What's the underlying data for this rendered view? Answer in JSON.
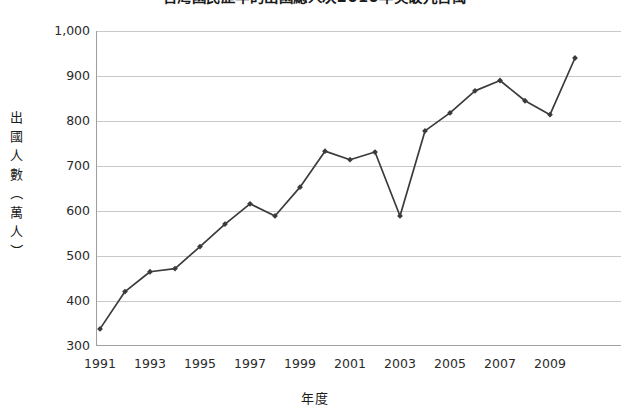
{
  "chart_data": {
    "type": "line",
    "title": "台灣國民歷年的出國總人次2010年突破九百萬",
    "xlabel": "年度",
    "ylabel": "出國人數（萬人）",
    "ylabel_chars": [
      "出",
      "國",
      "人",
      "數",
      "（",
      "萬",
      "人",
      "）"
    ],
    "x": [
      1991,
      1992,
      1993,
      1994,
      1995,
      1996,
      1997,
      1998,
      1999,
      2000,
      2001,
      2002,
      2003,
      2004,
      2005,
      2006,
      2007,
      2008,
      2009,
      2010
    ],
    "values": [
      338,
      421,
      465,
      472,
      521,
      571,
      616,
      589,
      653,
      733,
      714,
      731,
      589,
      778,
      818,
      867,
      890,
      845,
      814,
      940
    ],
    "series": [
      {
        "name": "出國人數（萬人）",
        "values": [
          338,
          421,
          465,
          472,
          521,
          571,
          616,
          589,
          653,
          733,
          714,
          731,
          589,
          778,
          818,
          867,
          890,
          845,
          814,
          940
        ]
      }
    ],
    "xlim": [
      1990.5,
      2010.5
    ],
    "ylim": [
      300,
      1000
    ],
    "yticks": [
      300,
      400,
      500,
      600,
      700,
      800,
      900,
      1000
    ],
    "ytick_labels": [
      "300",
      "400",
      "500",
      "600",
      "700",
      "800",
      "900",
      "1,000"
    ],
    "xticks": [
      1991,
      1993,
      1995,
      1997,
      1999,
      2001,
      2003,
      2005,
      2007,
      2009
    ],
    "xtick_labels": [
      "1991",
      "1993",
      "1995",
      "1997",
      "1999",
      "2001",
      "2003",
      "2005",
      "2007",
      "2009"
    ],
    "grid": "horizontal",
    "legend": "none",
    "line_color": "#3b3b3b",
    "marker": "diamond",
    "marker_color": "#3b3b3b",
    "grid_color": "#c9c9c9",
    "axis_color": "#a0a0a0",
    "background": "#ffffff"
  }
}
